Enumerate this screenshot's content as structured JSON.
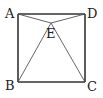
{
  "figure": {
    "type": "geometry",
    "points": {
      "A": {
        "label": "A"
      },
      "B": {
        "label": "B"
      },
      "C": {
        "label": "C"
      },
      "D": {
        "label": "D"
      },
      "E": {
        "label": "E"
      }
    },
    "segments": [
      [
        "A",
        "D"
      ],
      [
        "D",
        "C"
      ],
      [
        "C",
        "B"
      ],
      [
        "B",
        "A"
      ],
      [
        "A",
        "E"
      ],
      [
        "D",
        "E"
      ],
      [
        "B",
        "E"
      ],
      [
        "C",
        "E"
      ]
    ],
    "colors": {
      "square_stroke": "#333333",
      "inner_stroke": "#555555",
      "label": "#222222"
    }
  }
}
